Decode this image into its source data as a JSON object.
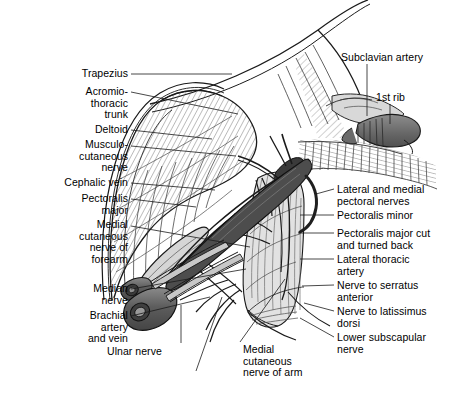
{
  "figure": {
    "width": 453,
    "height": 395,
    "background": "#ffffff",
    "ink": "#000000"
  },
  "palette": {
    "outline": "#1a1a1a",
    "muscle_light": "#dcdcdc",
    "muscle_mid": "#c0c0c0",
    "muscle_dark": "#9a9a9a",
    "vessel_dark": "#5a5a5a",
    "vessel_mid": "#7d7d7d",
    "bone_gray": "#6e6e6e",
    "hatch": "#6b6b6b",
    "white": "#ffffff",
    "leader": "#1a1a1a"
  },
  "labels_left": [
    {
      "id": "trapezius",
      "text": "Trapezius",
      "x": 38,
      "y": 68,
      "w": 90,
      "leader": [
        [
          131,
          74
        ],
        [
          232,
          74
        ]
      ]
    },
    {
      "id": "acromiothoracic",
      "text": "Acromio-\nthoracic\ntrunk",
      "x": 18,
      "y": 86,
      "w": 110,
      "leader": [
        [
          131,
          92
        ],
        [
          238,
          114
        ]
      ]
    },
    {
      "id": "deltoid",
      "text": "Deltoid",
      "x": 48,
      "y": 124,
      "w": 80,
      "leader": [
        [
          131,
          130
        ],
        [
          212,
          139
        ]
      ]
    },
    {
      "id": "musculocutaneous",
      "text": "Musculo-\ncutaneous\nnerve",
      "x": 14,
      "y": 139,
      "w": 114,
      "leader": [
        [
          131,
          146
        ],
        [
          236,
          156
        ]
      ]
    },
    {
      "id": "cephalic-vein",
      "text": "Cephalic vein",
      "x": 20,
      "y": 177,
      "w": 108,
      "leader": [
        [
          131,
          183
        ],
        [
          215,
          190
        ]
      ]
    },
    {
      "id": "pectoralis-major",
      "text": "Pectoralis\nmajor",
      "x": 30,
      "y": 193,
      "w": 98,
      "leader": [
        [
          131,
          199
        ],
        [
          196,
          207
        ]
      ]
    },
    {
      "id": "medial-cut-forearm",
      "text": "Medial\ncutaneous\nnerve of\nforearm",
      "x": 18,
      "y": 219,
      "w": 110,
      "leader": [
        [
          131,
          226
        ],
        [
          250,
          247
        ]
      ]
    },
    {
      "id": "median-nerve",
      "text": "Median\nnerve",
      "x": 36,
      "y": 283,
      "w": 92,
      "leader": [
        [
          131,
          289
        ],
        [
          246,
          269
        ]
      ]
    },
    {
      "id": "brachial-artery-vein",
      "text": "Brachial\nartery\nand vein",
      "x": 30,
      "y": 310,
      "w": 98,
      "leader": [
        [
          131,
          316
        ],
        [
          210,
          297
        ]
      ]
    }
  ],
  "labels_right": [
    {
      "id": "subclavian-artery",
      "text": "Subclavian artery",
      "x": 341,
      "y": 52,
      "w": 112,
      "leader": [
        [
          367,
          64
        ],
        [
          367,
          116
        ]
      ]
    },
    {
      "id": "first-rib",
      "text": "1st rib",
      "x": 376,
      "y": 92,
      "w": 60,
      "leader": [
        [
          390,
          104
        ],
        [
          390,
          124
        ]
      ]
    },
    {
      "id": "lateral-medial-pect",
      "text": "Lateral and medial\npectoral nerves",
      "x": 337,
      "y": 184,
      "w": 116,
      "leader": [
        [
          334,
          189
        ],
        [
          316,
          194
        ]
      ]
    },
    {
      "id": "pectoralis-minor",
      "text": "Pectoralis minor",
      "x": 337,
      "y": 210,
      "w": 116,
      "leader": [
        [
          334,
          215
        ],
        [
          300,
          215
        ]
      ]
    },
    {
      "id": "pect-major-cut",
      "text": "Pectoralis major cut\nand turned back",
      "x": 337,
      "y": 228,
      "w": 116,
      "leader": [
        [
          334,
          233
        ],
        [
          298,
          233
        ]
      ]
    },
    {
      "id": "lateral-thoracic",
      "text": "Lateral thoracic\nartery",
      "x": 337,
      "y": 254,
      "w": 116,
      "leader": [
        [
          334,
          259
        ],
        [
          300,
          259
        ]
      ]
    },
    {
      "id": "nerve-serratus",
      "text": "Nerve to serratus\nanterior",
      "x": 337,
      "y": 280,
      "w": 116,
      "leader": [
        [
          334,
          285
        ],
        [
          302,
          286
        ]
      ]
    },
    {
      "id": "nerve-latissimus",
      "text": "Nerve to latissimus\ndorsi",
      "x": 337,
      "y": 306,
      "w": 116,
      "leader": [
        [
          334,
          311
        ],
        [
          304,
          303
        ]
      ]
    },
    {
      "id": "lower-subscapular",
      "text": "Lower subscapular\nnerve",
      "x": 337,
      "y": 332,
      "w": 116,
      "leader": [
        [
          334,
          337
        ],
        [
          300,
          318
        ]
      ]
    }
  ],
  "labels_bottom": [
    {
      "id": "ulnar-nerve",
      "text": "Ulnar nerve",
      "x": 107,
      "y": 346,
      "w": 80,
      "leader": [
        [
          181,
          343
        ],
        [
          181,
          305
        ]
      ]
    },
    {
      "id": "medial-cut-arm",
      "text": "Medial\ncutaneous\nnerve of arm",
      "x": 243,
      "y": 344,
      "w": 90,
      "leader": [
        [
          240,
          342
        ],
        [
          285,
          279
        ]
      ]
    },
    {
      "id": "unlabeled-leader",
      "text": "",
      "x": 0,
      "y": 0,
      "w": 0,
      "leader": [
        [
          196,
          371
        ],
        [
          222,
          297
        ]
      ]
    }
  ]
}
